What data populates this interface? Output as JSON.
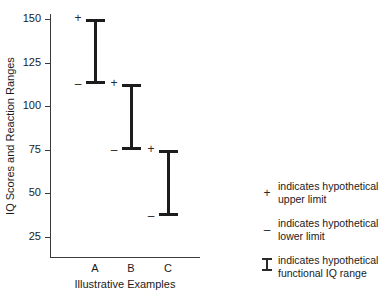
{
  "chart_data": {
    "type": "bar",
    "chart_style": "range-interval (I-beam) plot",
    "title": "",
    "xlabel": "Illustrative Examples",
    "ylabel": "IQ Scores and Reaction Ranges",
    "categories": [
      "A",
      "B",
      "C"
    ],
    "ylim": [
      0,
      160
    ],
    "yticks": [
      25,
      50,
      75,
      100,
      125,
      150
    ],
    "ytick_labels": [
      "25",
      "50",
      "75",
      "100",
      "125",
      "150"
    ],
    "grid": false,
    "legend_position": "right",
    "series": [
      {
        "name": "Hypothetical functional IQ range",
        "ranges": [
          {
            "category": "A",
            "lower": 113,
            "upper": 150
          },
          {
            "category": "B",
            "lower": 75,
            "upper": 113
          },
          {
            "category": "C",
            "lower": 37,
            "upper": 75
          }
        ]
      }
    ],
    "marks": {
      "upper_limit_symbol": "+",
      "lower_limit_symbol": "–"
    },
    "colors": {
      "bar": "#1c1c1c",
      "axis": "#3a3a3a",
      "text": "#1a1a1a",
      "background": "#ffffff"
    }
  },
  "axes": {
    "y_title": "IQ Scores and Reaction Ranges",
    "x_title": "Illustrative Examples",
    "y_ticks": [
      {
        "value": 150,
        "label": "150"
      },
      {
        "value": 125,
        "label": "125"
      },
      {
        "value": 100,
        "label": "100"
      },
      {
        "value": 75,
        "label": "75"
      },
      {
        "value": 50,
        "label": "50"
      },
      {
        "value": 25,
        "label": "25"
      }
    ],
    "categories": [
      {
        "label": "A"
      },
      {
        "label": "B"
      },
      {
        "label": "C"
      }
    ]
  },
  "bars": [
    {
      "label": "A",
      "upper": 150,
      "lower": 113,
      "upper_symbol": "+",
      "lower_symbol": "–"
    },
    {
      "label": "B",
      "upper": 113,
      "lower": 75,
      "upper_symbol": "+",
      "lower_symbol": "–"
    },
    {
      "label": "C",
      "upper": 75,
      "lower": 37,
      "upper_symbol": "+",
      "lower_symbol": "–"
    }
  ],
  "legend": {
    "items": [
      {
        "symbol": "+",
        "line1": "indicates hypothetical",
        "line2": "upper limit"
      },
      {
        "symbol": "–",
        "line1": "indicates hypothetical",
        "line2": "lower limit"
      },
      {
        "symbol": "ibeam",
        "line1": "indicates hypothetical",
        "line2": "functional IQ range"
      }
    ]
  }
}
